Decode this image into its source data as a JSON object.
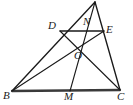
{
  "figure": {
    "canvas": {
      "width": 133,
      "height": 105
    },
    "stroke_color": "#1a1a1a",
    "base_stroke_color": "#3a3a3a",
    "background_color": "#ffffff",
    "points": {
      "A": {
        "label": "",
        "x": 95,
        "y": 2,
        "labeled": false
      },
      "B": {
        "label": "B",
        "x": 12,
        "y": 91,
        "label_x": 3,
        "label_y": 90
      },
      "C": {
        "label": "C",
        "x": 120,
        "y": 90,
        "label_x": 117,
        "label_y": 91
      },
      "D": {
        "label": "D",
        "x": 60,
        "y": 31,
        "label_x": 48,
        "label_y": 20
      },
      "E": {
        "label": "E",
        "x": 104,
        "y": 31,
        "label_x": 106,
        "label_y": 24
      },
      "M": {
        "label": "M",
        "x": 70,
        "y": 91,
        "label_x": 64,
        "label_y": 91
      },
      "N": {
        "label": "N",
        "x": 86,
        "y": 31,
        "label_x": 83,
        "label_y": 16
      },
      "O": {
        "label": "O",
        "x": 78,
        "y": 47,
        "label_x": 74,
        "label_y": 50
      }
    },
    "segments": [
      {
        "name": "side-AB",
        "from": "A",
        "to": "B",
        "weight": "med"
      },
      {
        "name": "side-AC",
        "from": "A",
        "to": "C",
        "weight": "med"
      },
      {
        "name": "side-BC",
        "from": "B",
        "to": "C",
        "weight": "base"
      },
      {
        "name": "midsegment-DE",
        "from": "D",
        "to": "E",
        "weight": "med"
      },
      {
        "name": "cevian-AM",
        "from": "A",
        "to": "M",
        "weight": "thin"
      },
      {
        "name": "cevian-BE",
        "from": "B",
        "to": "E",
        "weight": "thin"
      },
      {
        "name": "cevian-DC",
        "from": "D",
        "to": "C",
        "weight": "thin"
      }
    ]
  }
}
